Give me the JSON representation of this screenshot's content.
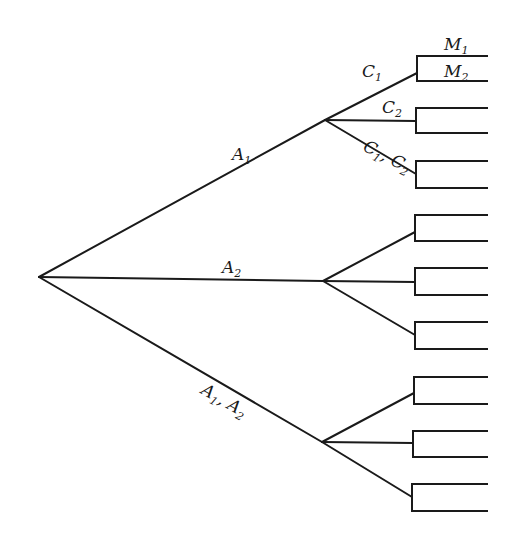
{
  "diagram": {
    "type": "decision-tree",
    "root": {
      "x": 39,
      "y": 277
    },
    "level1": [
      {
        "id": "A1",
        "label": "A",
        "sub": "1",
        "node": {
          "x": 325,
          "y": 120
        },
        "label_pos": {
          "x": 232,
          "y": 160,
          "rotate": 0
        },
        "children": [
          {
            "id": "C1",
            "label": "C",
            "sub": "1",
            "label_pos": {
              "x": 362,
              "y": 77,
              "rotate": 0
            },
            "bracket": {
              "x": 417,
              "top": 56,
              "bottom": 81,
              "join": 73
            }
          },
          {
            "id": "C2",
            "label": "C",
            "sub": "2",
            "label_pos": {
              "x": 382,
              "y": 113,
              "rotate": 0
            },
            "bracket": {
              "x": 416,
              "top": 108,
              "bottom": 133,
              "join": 121
            }
          },
          {
            "id": "C1C2",
            "label": "C",
            "sub": "1",
            "label2": "C",
            "sub2": "2",
            "label_pos": {
              "x": 362,
              "y": 150,
              "rotate": 27
            },
            "bracket": {
              "x": 416,
              "top": 161,
              "bottom": 188,
              "join": 174
            }
          }
        ]
      },
      {
        "id": "A2",
        "label": "A",
        "sub": "2",
        "node": {
          "x": 323,
          "y": 281
        },
        "label_pos": {
          "x": 222,
          "y": 273,
          "rotate": 0
        },
        "children": [
          {
            "id": "A2-1",
            "bracket": {
              "x": 415,
              "top": 215,
              "bottom": 241,
              "join": 232
            }
          },
          {
            "id": "A2-2",
            "bracket": {
              "x": 415,
              "top": 268,
              "bottom": 295,
              "join": 282
            }
          },
          {
            "id": "A2-3",
            "bracket": {
              "x": 415,
              "top": 322,
              "bottom": 349,
              "join": 335
            }
          }
        ]
      },
      {
        "id": "A1A2",
        "label": "A",
        "sub": "1",
        "label2": "A",
        "sub2": "2",
        "node": {
          "x": 322,
          "y": 442
        },
        "label_pos": {
          "x": 200,
          "y": 393,
          "rotate": 30
        },
        "children": [
          {
            "id": "A12-1",
            "bracket": {
              "x": 414,
              "top": 377,
              "bottom": 404,
              "join": 393
            }
          },
          {
            "id": "A12-2",
            "bracket": {
              "x": 413,
              "top": 431,
              "bottom": 457,
              "join": 443
            }
          },
          {
            "id": "A12-3",
            "bracket": {
              "x": 412,
              "top": 484,
              "bottom": 511,
              "join": 497
            }
          }
        ]
      }
    ],
    "leaf_end_x": 488,
    "leaf_labels": [
      {
        "id": "M1",
        "label": "M",
        "sub": "1",
        "x": 444,
        "y": 50
      },
      {
        "id": "M2",
        "label": "M",
        "sub": "2",
        "x": 444,
        "y": 77
      }
    ]
  }
}
